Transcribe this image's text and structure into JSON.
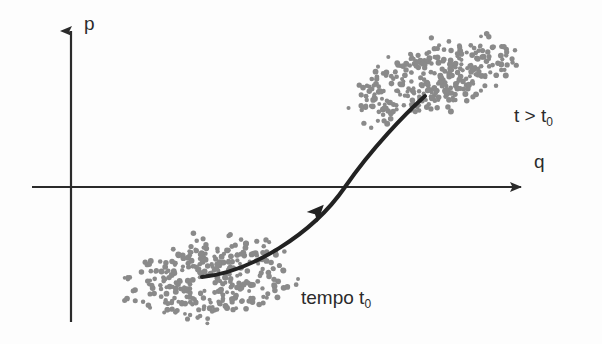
{
  "figure": {
    "type": "phase-space-diagram",
    "background_color": "#fdfdfd",
    "ink_color": "#2b2b2b",
    "dot_color": "#8a8a8a"
  },
  "axes": {
    "vertical": {
      "label": "p",
      "name": "momentum-axis",
      "x": 71,
      "y_top": 28,
      "y_bottom": 322,
      "arrow": "up"
    },
    "horizontal": {
      "label": "q",
      "name": "position-axis",
      "y": 187,
      "x_left": 32,
      "x_right": 533,
      "arrow": "right"
    }
  },
  "labels": {
    "p_axis": "p",
    "q_axis": "q",
    "upper_cloud_prefix": "t > t",
    "upper_cloud_subscript": "0",
    "lower_cloud_prefix": "tempo t",
    "lower_cloud_subscript": "0"
  },
  "clouds": [
    {
      "name": "lower-point-cloud",
      "description": "initial ensemble at time t0",
      "center_x": 212,
      "center_y": 278,
      "radius_x": 97,
      "radius_y": 48,
      "rotation_deg": -8,
      "point_count": 330,
      "dot_radius": 2.4,
      "color": "#8a8a8a"
    },
    {
      "name": "upper-point-cloud",
      "description": "evolved ensemble at time t greater than t0",
      "center_x": 432,
      "center_y": 78,
      "radius_x": 104,
      "radius_y": 40,
      "rotation_deg": -20,
      "point_count": 330,
      "dot_radius": 2.4,
      "color": "#8a8a8a"
    }
  ],
  "flow_curve": {
    "name": "evolution-trajectory",
    "path": "M 202 277 C 250 272, 312 235, 345 187 C 372 148, 405 114, 425 96",
    "stroke_width": 4,
    "color": "#222222",
    "arrowhead": {
      "x": 318,
      "y": 211,
      "angle_deg": -47
    }
  },
  "chart_data": {
    "type": "scatter",
    "title": "",
    "xlabel": "q",
    "ylabel": "p",
    "grid": false,
    "legend": false,
    "annotations": [
      "t > t₀",
      "tempo t₀"
    ],
    "series": [
      {
        "name": "tempo t₀",
        "n_points": 330,
        "center": [
          212,
          278
        ],
        "spread": [
          97,
          48
        ]
      },
      {
        "name": "t > t₀",
        "n_points": 330,
        "center": [
          432,
          78
        ],
        "spread": [
          104,
          40
        ]
      }
    ]
  }
}
